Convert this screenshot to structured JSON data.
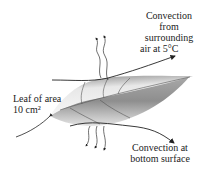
{
  "diagram": {
    "type": "heat-transfer-illustration",
    "subject": "leaf",
    "labels": {
      "top_convection": [
        "Convection",
        "from",
        "surrounding",
        "air at 5°C"
      ],
      "leaf_area": [
        "Leaf of area",
        "10 cm²"
      ],
      "bottom_convection": [
        "Convection at",
        "bottom surface"
      ]
    },
    "colors": {
      "leaf_dark": "#6e6e6e",
      "leaf_light": "#f2f2f2",
      "line": "#333333"
    }
  }
}
